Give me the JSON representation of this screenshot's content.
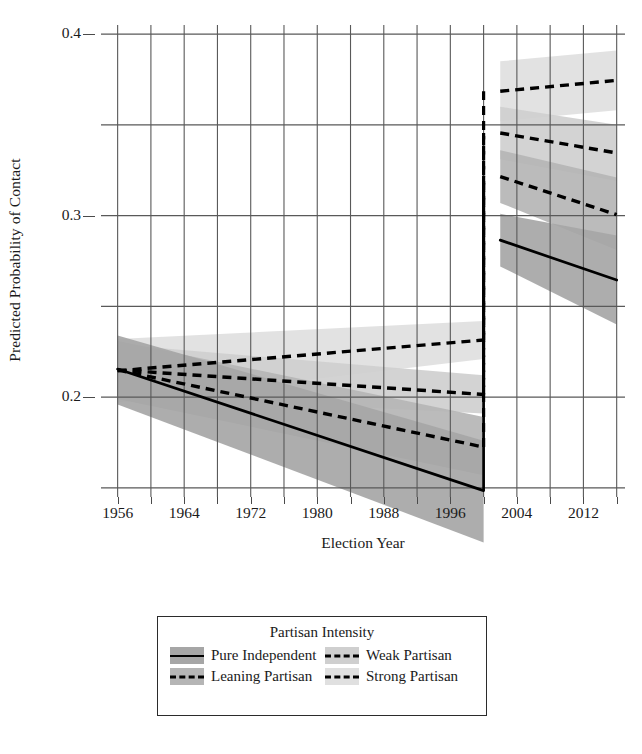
{
  "chart_data": {
    "type": "line",
    "title": "",
    "xlabel": "Election Year",
    "ylabel": "Predicted Probability of Contact",
    "legend_title": "Partisan Intensity",
    "legend_position": "bottom",
    "grid": true,
    "xlim": [
      1954,
      2017
    ],
    "ylim": [
      0.145,
      0.405
    ],
    "yticks": [
      0.2,
      0.3,
      0.4
    ],
    "ytick_labels": [
      "0.2",
      "0.3",
      "0.4"
    ],
    "y_minor_gridlines": [
      0.15,
      0.25,
      0.35
    ],
    "xticks": [
      1956,
      1960,
      1964,
      1968,
      1972,
      1976,
      1980,
      1984,
      1988,
      1992,
      1996,
      2000,
      2004,
      2008,
      2012,
      2016
    ],
    "xtick_labels": [
      "1956",
      "1964",
      "1972",
      "1980",
      "1988",
      "1996",
      "2004",
      "2012"
    ],
    "xtick_label_values": [
      1956,
      1964,
      1972,
      1980,
      1988,
      1996,
      2004,
      2012
    ],
    "break_note": "Discontinuity between 2000 and 2002",
    "segments": {
      "pre": [
        1956,
        2000
      ],
      "post": [
        2002,
        2016
      ]
    },
    "series": [
      {
        "name": "Pure Independent",
        "linestyle": "solid",
        "color": "#000000",
        "ribbon_color": "#a6a6a6",
        "pre": {
          "x": [
            1956,
            2000
          ],
          "y": [
            0.2155,
            0.1485
          ],
          "lo": [
            0.196,
            0.12
          ],
          "hi": [
            0.234,
            0.176
          ]
        },
        "post": {
          "x": [
            2002,
            2016
          ],
          "y": [
            0.2865,
            0.2645
          ],
          "lo": [
            0.272,
            0.24
          ],
          "hi": [
            0.301,
            0.289
          ]
        }
      },
      {
        "name": "Leaning Partisan",
        "linestyle": "dashed",
        "color": "#000000",
        "ribbon_color": "#b5b5b5",
        "pre": {
          "x": [
            1956,
            2000
          ],
          "y": [
            0.215,
            0.1725
          ],
          "lo": [
            0.199,
            0.157
          ],
          "hi": [
            0.231,
            0.189
          ]
        },
        "post": {
          "x": [
            2002,
            2016
          ],
          "y": [
            0.3215,
            0.3005
          ],
          "lo": [
            0.307,
            0.281
          ],
          "hi": [
            0.336,
            0.321
          ]
        }
      },
      {
        "name": "Weak Partisan",
        "linestyle": "dashed",
        "color": "#000000",
        "ribbon_color": "#cfcfcf",
        "pre": {
          "x": [
            1956,
            2000
          ],
          "y": [
            0.215,
            0.2015
          ],
          "lo": [
            0.201,
            0.191
          ],
          "hi": [
            0.229,
            0.212
          ]
        },
        "post": {
          "x": [
            2002,
            2016
          ],
          "y": [
            0.3455,
            0.3345
          ],
          "lo": [
            0.331,
            0.319
          ],
          "hi": [
            0.36,
            0.35
          ]
        }
      },
      {
        "name": "Strong Partisan",
        "linestyle": "dashed",
        "color": "#000000",
        "ribbon_color": "#e0e0e0",
        "pre": {
          "x": [
            1956,
            2000
          ],
          "y": [
            0.2145,
            0.2315
          ],
          "lo": [
            0.197,
            0.221
          ],
          "hi": [
            0.232,
            0.242
          ]
        },
        "post": {
          "x": [
            2002,
            2016
          ],
          "y": [
            0.3685,
            0.3745
          ],
          "lo": [
            0.352,
            0.358
          ],
          "hi": [
            0.385,
            0.391
          ]
        }
      }
    ]
  },
  "axis": {
    "y_title": "Predicted Probability of Contact",
    "x_title": "Election Year"
  },
  "legend": {
    "title": "Partisan Intensity",
    "items": [
      {
        "label": "Pure Independent",
        "style": "solid",
        "swatch": "#a6a6a6"
      },
      {
        "label": "Weak Partisan",
        "style": "dashed",
        "swatch": "#cfcfcf"
      },
      {
        "label": "Leaning Partisan",
        "style": "dashed",
        "swatch": "#b5b5b5"
      },
      {
        "label": "Strong Partisan",
        "style": "dashed",
        "swatch": "#e0e0e0"
      }
    ]
  },
  "colors": {
    "axis": "#4a4a4a",
    "grid": "#595959",
    "line": "#000000",
    "background": "#ffffff"
  }
}
